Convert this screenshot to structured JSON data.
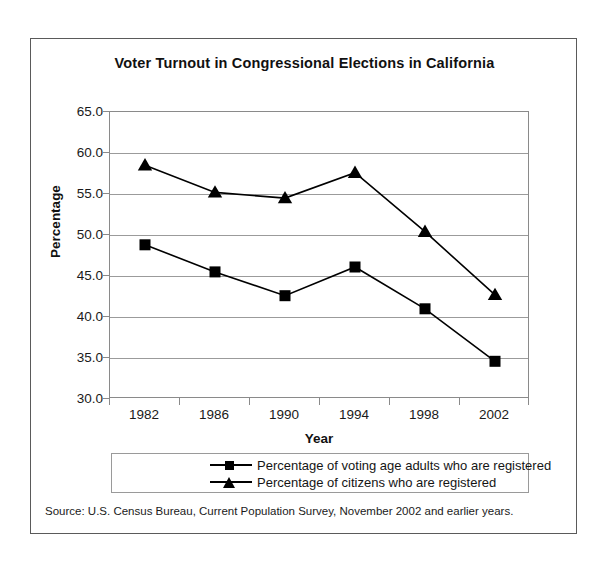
{
  "figure": {
    "title": "Voter Turnout in Congressional Elections in California",
    "source_note": "Source: U.S. Census Bureau, Current Population Survey, November 2002 and earlier years."
  },
  "chart_data": {
    "type": "line",
    "title": "Voter Turnout in Congressional Elections in California",
    "xlabel": "Year",
    "ylabel": "Percentage",
    "categories": [
      "1982",
      "1986",
      "1990",
      "1994",
      "1998",
      "2002"
    ],
    "ylim": [
      30.0,
      65.0
    ],
    "ytick_labels": [
      "65.0",
      "60.0",
      "55.0",
      "50.0",
      "45.0",
      "40.0",
      "35.0",
      "30.0"
    ],
    "yticks": [
      65.0,
      60.0,
      55.0,
      50.0,
      45.0,
      40.0,
      35.0,
      30.0
    ],
    "grid": true,
    "legend_position": "bottom",
    "series": [
      {
        "name": "Percentage of voting age adults who are registered",
        "marker": "square",
        "color": "#000000",
        "values": [
          48.8,
          45.5,
          42.6,
          46.1,
          41.0,
          34.6
        ]
      },
      {
        "name": "Percentage of citizens who are registered",
        "marker": "triangle",
        "color": "#000000",
        "values": [
          58.5,
          55.2,
          54.5,
          57.6,
          50.4,
          42.7
        ]
      }
    ]
  }
}
